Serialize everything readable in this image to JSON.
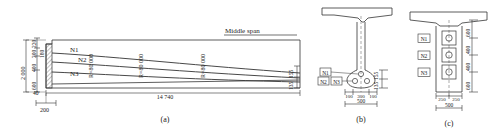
{
  "figure": {
    "panels": [
      {
        "id": "a",
        "caption": "(a)",
        "type": "elevation"
      },
      {
        "id": "b",
        "caption": "(b)",
        "type": "cross-section-midspan"
      },
      {
        "id": "c",
        "caption": "(c)",
        "type": "cross-section-support"
      }
    ]
  },
  "elevation": {
    "caption": "(a)",
    "middle_span_label": "Middle span",
    "tendons": [
      {
        "name": "N1",
        "radius_label": "R=80 000"
      },
      {
        "name": "N2",
        "radius_label": "R=80 000"
      },
      {
        "name": "N3",
        "radius_label": "R=80 000"
      }
    ],
    "radius_labels": [
      "R=80 000",
      "R=80 000",
      "R=80 000"
    ],
    "tendon_names": [
      "N1",
      "N2",
      "N3"
    ],
    "left_dims": {
      "overall": "2 000",
      "stack": [
        "220",
        "200",
        "400",
        "600"
      ],
      "web_top": "180",
      "bottom": "40"
    },
    "bottom_dims": {
      "pier": "200",
      "span": "14 740"
    },
    "right_dims": {
      "upper": "155",
      "lower": "135"
    }
  },
  "section_b": {
    "caption": "(b)",
    "duct_labels": [
      "N1",
      "N2",
      "N3"
    ],
    "vertical_dims": [
      "155",
      "135"
    ],
    "horizontal_dims": [
      "100",
      "300",
      "100"
    ],
    "total_width": "500"
  },
  "section_c": {
    "caption": "(c)",
    "duct_labels": [
      "N1",
      "N2",
      "N3"
    ],
    "vertical_dims": [
      "600",
      "400",
      "400",
      "600"
    ],
    "horizontal_dims": [
      "250",
      "250"
    ],
    "total_width": "500"
  },
  "colors": {
    "line": "#333333",
    "thin_line": "#555555",
    "hatch": "#666666",
    "text": "#1a1a1a",
    "background": "#ffffff"
  }
}
